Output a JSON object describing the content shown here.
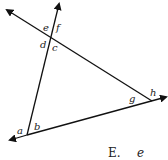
{
  "diagram": {
    "angle_labels": {
      "a": "a",
      "b": "b",
      "c": "c",
      "d": "d",
      "e": "e",
      "f": "f",
      "g": "g",
      "h": "h"
    },
    "colors": {
      "line": "#111111",
      "text": "#222222"
    }
  },
  "answer_option": {
    "letter": "E.",
    "value": "e"
  }
}
